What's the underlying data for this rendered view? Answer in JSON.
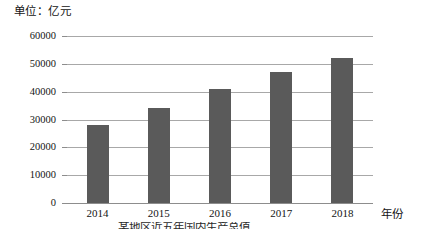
{
  "chart_data": {
    "type": "bar",
    "title": "",
    "unit_label": "单位：亿元",
    "xlabel": "年份",
    "ylabel": "",
    "categories": [
      "2014",
      "2015",
      "2016",
      "2017",
      "2018"
    ],
    "values": [
      28000,
      34000,
      41000,
      47000,
      52000
    ],
    "ylim": [
      0,
      60000
    ],
    "ytick_labels": [
      "60000",
      "50000",
      "40000",
      "30000",
      "20000",
      "10000",
      "0"
    ],
    "ytick_values": [
      60000,
      50000,
      40000,
      30000,
      20000,
      10000,
      0
    ],
    "grid": true,
    "legend": "none",
    "bar_color": "#5a5a5a",
    "gridline_color": "#a8a8a8",
    "axis_color": "#8d8d8d",
    "background": "#ffffff",
    "caption": "某地区近五年国内生产总值"
  }
}
